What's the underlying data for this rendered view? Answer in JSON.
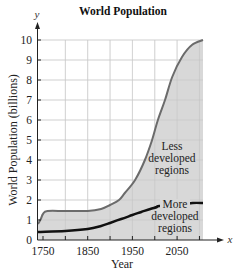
{
  "chart_data": {
    "type": "area",
    "title": "World Population",
    "xlabel": "Year",
    "ylabel": "World Population (billions)",
    "x_axis_var": "x",
    "y_axis_var": "y",
    "xlim": [
      1740,
      2110
    ],
    "ylim": [
      0,
      10
    ],
    "x_ticks": [
      1750,
      1850,
      1950,
      2050
    ],
    "y_ticks": [
      0,
      1,
      2,
      3,
      4,
      5,
      6,
      7,
      8,
      9,
      10
    ],
    "grid": true,
    "series": [
      {
        "name": "Total (Less developed + More developed)",
        "color": "#6b6b6b",
        "fill": "#d8d8d8",
        "x": [
          1740,
          1745,
          1750,
          1760,
          1800,
          1850,
          1880,
          1900,
          1920,
          1933,
          1956,
          1978,
          1994,
          2007,
          2023,
          2039,
          2061,
          2083,
          2108
        ],
        "values": [
          0.8,
          1.05,
          1.3,
          1.45,
          1.45,
          1.45,
          1.55,
          1.75,
          2.0,
          2.35,
          3.0,
          4.0,
          5.0,
          6.0,
          7.0,
          8.15,
          9.15,
          9.75,
          10.0
        ]
      },
      {
        "name": "More developed regions",
        "color": "#111111",
        "x": [
          1740,
          1800,
          1850,
          1880,
          1900,
          1925,
          1950,
          1970,
          1990,
          2005,
          2010,
          2060,
          2085,
          2108
        ],
        "values": [
          0.4,
          0.45,
          0.55,
          0.7,
          0.85,
          1.05,
          1.25,
          1.4,
          1.55,
          1.65,
          1.7,
          1.78,
          1.85,
          1.85
        ]
      }
    ],
    "annotations": [
      {
        "text_lines": [
          "Less",
          "developed",
          "regions"
        ],
        "x": 2060,
        "y": 4.7
      },
      {
        "text_lines": [
          "More",
          "developed",
          "regions"
        ],
        "x": 2060,
        "y": 1.7
      }
    ]
  },
  "labels": {
    "title": "World Population",
    "xlabel": "Year",
    "ylabel": "World Population (billions)",
    "x_var": "x",
    "y_var": "y",
    "less": [
      "Less",
      "developed",
      "regions"
    ],
    "more": [
      "More",
      "developed",
      "regions"
    ]
  }
}
